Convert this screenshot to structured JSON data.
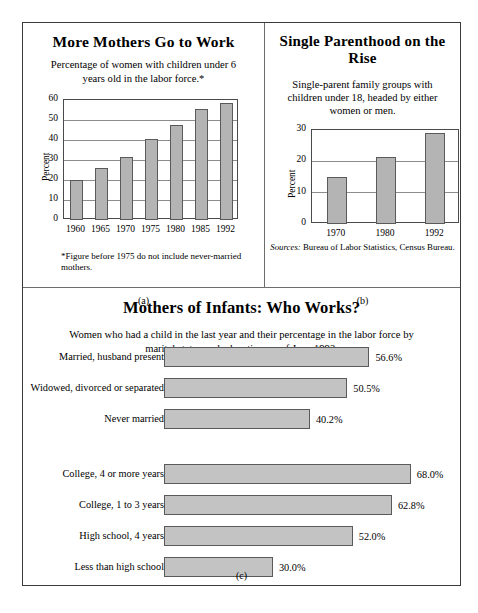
{
  "figure": {
    "panel_a_caption": "(a)",
    "panel_b_caption": "(b)",
    "panel_c_caption": "(c)"
  },
  "panel_a": {
    "title": "More Mothers Go to Work",
    "subtitle": "Percentage of women with children under 6 years old in the labor force.*",
    "footnote": "*Figure before 1975 do not include never-married mothers."
  },
  "panel_b": {
    "title": "Single Parenthood on the Rise",
    "subtitle": "Single-parent family groups with children under 18, headed by either women or men.",
    "sources_label": "Sources:",
    "sources_text": " Bureau of Labor Statistics, Census Bureau."
  },
  "panel_c": {
    "title": "Mothers of Infants: Who Works?",
    "subtitle": "Women who had a child in the last year and their percentage in the labor force by marital status and education, as of June 1992."
  },
  "chart_data": [
    {
      "type": "bar",
      "id": "chart-a",
      "title": "More Mothers Go to Work",
      "subtitle": "Percentage of women with children under 6 years old in the labor force.*",
      "orientation": "vertical",
      "xlabel": "",
      "ylabel": "Percent",
      "ylim": [
        0,
        60
      ],
      "yticks": [
        0,
        10,
        20,
        30,
        40,
        50,
        60
      ],
      "grid": true,
      "legend": "none",
      "categories": [
        "1960",
        "1965",
        "1970",
        "1975",
        "1980",
        "1985",
        "1992"
      ],
      "values": [
        20,
        26,
        31.5,
        40.5,
        47.5,
        55.5,
        58.5
      ],
      "bar_color": "#b4b4b4"
    },
    {
      "type": "bar",
      "id": "chart-b",
      "title": "Single Parenthood on the Rise",
      "subtitle": "Single-parent family groups with children under 18, headed by either women or men.",
      "orientation": "vertical",
      "xlabel": "",
      "ylabel": "Percent",
      "ylim": [
        0,
        30
      ],
      "yticks": [
        0,
        10,
        20,
        30
      ],
      "grid": true,
      "legend": "none",
      "categories": [
        "1970",
        "1980",
        "1992"
      ],
      "values": [
        15,
        21.5,
        29
      ],
      "bar_color": "#b4b4b4"
    },
    {
      "type": "bar",
      "id": "chart-c",
      "title": "Mothers of Infants: Who Works?",
      "subtitle": "Women who had a child in the last year and their percentage in the labor force by marital status and education, as of June 1992.",
      "orientation": "horizontal",
      "xlabel": "",
      "ylabel": "",
      "xlim": [
        0,
        70
      ],
      "grid": false,
      "legend": "none",
      "groups": [
        {
          "name": "marital status",
          "categories": [
            "Married, husband present",
            "Widowed, divorced or separated",
            "Never married"
          ],
          "values": [
            56.6,
            50.5,
            40.2
          ],
          "value_labels": [
            "56.6%",
            "50.5%",
            "40.2%"
          ]
        },
        {
          "name": "education",
          "categories": [
            "College, 4 or more years",
            "College, 1 to 3 years",
            "High school, 4 years",
            "Less than high school"
          ],
          "values": [
            68.0,
            62.8,
            52.0,
            30.0
          ],
          "value_labels": [
            "68.0%",
            "62.8%",
            "52.0%",
            "30.0%"
          ]
        }
      ],
      "bar_color": "#c3c3c3"
    }
  ]
}
